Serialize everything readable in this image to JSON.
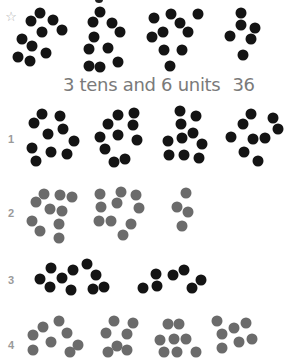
{
  "colors": {
    "black_dot": "#141414",
    "gray_dot": "#6b6b6b",
    "label": "#9a9a9a",
    "caption": "#7a7a7a"
  },
  "example": {
    "marker": "☆",
    "caption_text": "3 tens and 6 units",
    "caption_number": "36",
    "groups": [
      {
        "count": 10,
        "color": "black",
        "dots": [
          [
            40,
            13
          ],
          [
            31,
            21
          ],
          [
            53,
            20
          ],
          [
            42,
            32
          ],
          [
            62,
            30
          ],
          [
            22,
            39
          ],
          [
            32,
            46
          ],
          [
            46,
            53
          ],
          [
            18,
            57
          ],
          [
            30,
            61
          ]
        ]
      },
      {
        "count": 10,
        "color": "black",
        "dots": [
          [
            100,
            12
          ],
          [
            93,
            22
          ],
          [
            112,
            23
          ],
          [
            120,
            32
          ],
          [
            94,
            37
          ],
          [
            89,
            49
          ],
          [
            108,
            48
          ],
          [
            89,
            66
          ],
          [
            100,
            67
          ],
          [
            118,
            62
          ]
        ]
      },
      {
        "count": 10,
        "color": "black",
        "dots": [
          [
            154,
            18
          ],
          [
            171,
            14
          ],
          [
            198,
            14
          ],
          [
            180,
            23
          ],
          [
            188,
            32
          ],
          [
            152,
            37
          ],
          [
            163,
            32
          ],
          [
            164,
            50
          ],
          [
            182,
            50
          ],
          [
            170,
            66
          ]
        ]
      },
      {
        "count": 6,
        "color": "black",
        "dots": [
          [
            241,
            13
          ],
          [
            241,
            25
          ],
          [
            255,
            28
          ],
          [
            230,
            36
          ],
          [
            251,
            39
          ],
          [
            243,
            55
          ]
        ]
      }
    ]
  },
  "exercises": [
    {
      "label": "1",
      "label_pos": [
        11,
        139
      ],
      "color": "black",
      "groups": [
        {
          "dots": [
            [
              42,
              114
            ],
            [
              34,
              123
            ],
            [
              60,
              116
            ],
            [
              63,
              129
            ],
            [
              48,
              134
            ],
            [
              74,
              141
            ],
            [
              32,
              148
            ],
            [
              51,
              152
            ],
            [
              67,
              154
            ],
            [
              36,
              161
            ]
          ]
        },
        {
          "dots": [
            [
              118,
              115
            ],
            [
              134,
              113
            ],
            [
              108,
              124
            ],
            [
              133,
              125
            ],
            [
              100,
              137
            ],
            [
              118,
              135
            ],
            [
              137,
              140
            ],
            [
              105,
              149
            ],
            [
              114,
              162
            ],
            [
              125,
              159
            ]
          ]
        },
        {
          "dots": [
            [
              180,
              111
            ],
            [
              196,
              116
            ],
            [
              181,
              124
            ],
            [
              193,
              133
            ],
            [
              168,
              141
            ],
            [
              182,
              138
            ],
            [
              202,
              144
            ],
            [
              169,
              155
            ],
            [
              184,
              155
            ],
            [
              199,
              158
            ]
          ]
        },
        {
          "dots": [
            [
              251,
              114
            ],
            [
              243,
              124
            ],
            [
              273,
              118
            ],
            [
              278,
              129
            ],
            [
              231,
              137
            ],
            [
              253,
              139
            ],
            [
              265,
              138
            ],
            [
              244,
              152
            ],
            [
              258,
              161
            ]
          ]
        }
      ]
    },
    {
      "label": "2",
      "label_pos": [
        11,
        213
      ],
      "color": "gray",
      "groups": [
        {
          "dots": [
            [
              44,
              194
            ],
            [
              60,
              195
            ],
            [
              72,
              197
            ],
            [
              36,
              202
            ],
            [
              50,
              209
            ],
            [
              62,
              211
            ],
            [
              32,
              221
            ],
            [
              59,
              224
            ],
            [
              40,
              231
            ],
            [
              59,
              238
            ]
          ]
        },
        {
          "dots": [
            [
              100,
              194
            ],
            [
              121,
              192
            ],
            [
              136,
              195
            ],
            [
              101,
              207
            ],
            [
              117,
              203
            ],
            [
              139,
              208
            ],
            [
              99,
              221
            ],
            [
              111,
              221
            ],
            [
              131,
              224
            ],
            [
              123,
              235
            ]
          ]
        },
        {
          "dots": [
            [
              186,
              193
            ],
            [
              177,
              207
            ],
            [
              188,
              212
            ],
            [
              182,
              226
            ]
          ]
        }
      ]
    },
    {
      "label": "3",
      "label_pos": [
        11,
        280
      ],
      "color": "black",
      "groups": [
        {
          "dots": [
            [
              40,
              279
            ],
            [
              51,
              268
            ],
            [
              50,
              287
            ],
            [
              62,
              278
            ],
            [
              73,
              270
            ],
            [
              71,
              290
            ],
            [
              87,
              264
            ],
            [
              96,
              275
            ],
            [
              93,
              289
            ],
            [
              104,
              287
            ]
          ]
        },
        {
          "dots": [
            [
              143,
              288
            ],
            [
              156,
              274
            ],
            [
              157,
              286
            ],
            [
              173,
              275
            ],
            [
              184,
              270
            ],
            [
              192,
              288
            ],
            [
              201,
              280
            ]
          ]
        }
      ]
    },
    {
      "label": "4",
      "label_pos": [
        11,
        345
      ],
      "color": "gray",
      "groups": [
        {
          "dots": [
            [
              43,
              327
            ],
            [
              59,
              321
            ],
            [
              33,
              335
            ],
            [
              67,
              333
            ],
            [
              51,
              342
            ],
            [
              33,
              350
            ],
            [
              78,
              345
            ],
            [
              70,
              352
            ]
          ]
        },
        {
          "dots": [
            [
              114,
              321
            ],
            [
              133,
              323
            ],
            [
              106,
              333
            ],
            [
              127,
              334
            ],
            [
              117,
              346
            ],
            [
              127,
              350
            ],
            [
              108,
              352
            ]
          ]
        },
        {
          "dots": [
            [
              168,
              324
            ],
            [
              179,
              324
            ],
            [
              160,
              340
            ],
            [
              174,
              339
            ],
            [
              186,
              339
            ],
            [
              164,
              352
            ],
            [
              177,
              352
            ],
            [
              196,
              352
            ]
          ]
        },
        {
          "dots": [
            [
              217,
              321
            ],
            [
              234,
              328
            ],
            [
              246,
              323
            ],
            [
              222,
              334
            ],
            [
              239,
              342
            ],
            [
              252,
              339
            ],
            [
              222,
              348
            ]
          ]
        }
      ]
    }
  ]
}
